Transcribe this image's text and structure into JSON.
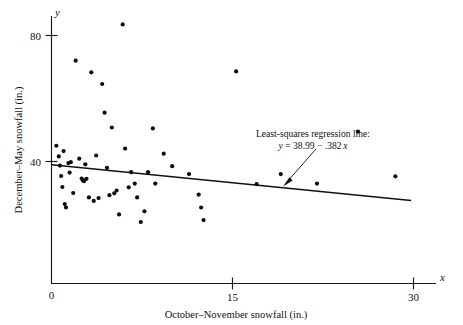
{
  "chart_data": {
    "type": "scatter",
    "title": "",
    "xlabel": "October–November snowfall (in.)",
    "ylabel": "December–May snowfall (in.)",
    "x_axis_variable": "x",
    "y_axis_variable": "y",
    "xlim": [
      0,
      31.5
    ],
    "ylim": [
      14,
      88
    ],
    "xticks": [
      0,
      15,
      30
    ],
    "xtick_labels": [
      "0",
      "15",
      "30"
    ],
    "yticks": [
      40,
      80
    ],
    "ytick_labels": [
      "40",
      "80"
    ],
    "grid": false,
    "legend": null,
    "marker": "filled-circle",
    "marker_color": "#0d0d0d",
    "points": [
      [
        0.4,
        45.0
      ],
      [
        0.6,
        41.6
      ],
      [
        0.7,
        38.7
      ],
      [
        0.8,
        35.4
      ],
      [
        0.9,
        31.9
      ],
      [
        1.0,
        43.3
      ],
      [
        1.1,
        26.5
      ],
      [
        1.2,
        25.4
      ],
      [
        1.4,
        39.5
      ],
      [
        1.5,
        36.5
      ],
      [
        1.6,
        39.8
      ],
      [
        1.8,
        30.0
      ],
      [
        2.0,
        72.0
      ],
      [
        2.3,
        40.9
      ],
      [
        2.5,
        34.6
      ],
      [
        2.6,
        34.0
      ],
      [
        2.7,
        33.8
      ],
      [
        2.8,
        39.1
      ],
      [
        2.9,
        34.5
      ],
      [
        3.1,
        28.6
      ],
      [
        3.3,
        68.3
      ],
      [
        3.5,
        27.5
      ],
      [
        3.7,
        41.9
      ],
      [
        3.9,
        28.4
      ],
      [
        4.2,
        64.6
      ],
      [
        4.4,
        55.5
      ],
      [
        4.6,
        38.0
      ],
      [
        4.8,
        29.3
      ],
      [
        5.0,
        50.8
      ],
      [
        5.2,
        29.9
      ],
      [
        5.4,
        30.8
      ],
      [
        5.6,
        23.2
      ],
      [
        5.9,
        83.5
      ],
      [
        6.1,
        44.1
      ],
      [
        6.4,
        31.8
      ],
      [
        6.6,
        36.6
      ],
      [
        6.9,
        33.0
      ],
      [
        7.1,
        28.6
      ],
      [
        7.4,
        20.8
      ],
      [
        7.7,
        24.2
      ],
      [
        8.0,
        36.6
      ],
      [
        8.4,
        50.5
      ],
      [
        8.6,
        33.0
      ],
      [
        9.3,
        42.5
      ],
      [
        10.0,
        38.5
      ],
      [
        11.4,
        36.0
      ],
      [
        12.2,
        29.5
      ],
      [
        12.4,
        25.4
      ],
      [
        12.6,
        21.4
      ],
      [
        15.3,
        68.6
      ],
      [
        17.0,
        32.8
      ],
      [
        19.0,
        36.0
      ],
      [
        22.0,
        33.0
      ],
      [
        25.4,
        49.5
      ],
      [
        28.5,
        35.3
      ]
    ],
    "regression_line": {
      "label_line1": "Least-squares regression line:",
      "label_line2_y": "y",
      "label_line2_eq": " = 38.99 − .382",
      "label_line2_x": "x",
      "equation": "y = 38.99 - .382x",
      "intercept": 38.99,
      "slope": -0.382,
      "x_start": 0,
      "x_end": 29.8
    }
  },
  "annotation": {
    "callout_text": "Least-squares regression line:",
    "callout_equation": "y = 38.99 − .382x"
  }
}
